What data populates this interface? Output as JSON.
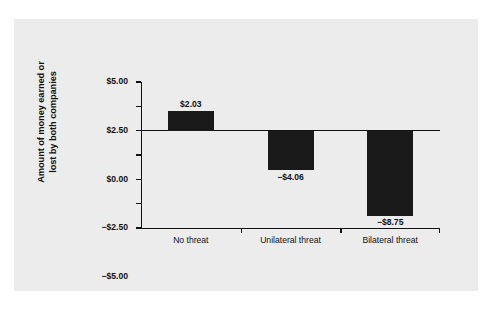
{
  "chart_data": {
    "type": "bar",
    "title": "",
    "xlabel": "",
    "ylabel_line1": "Amount of money earned or",
    "ylabel_line2": "lost by both companies",
    "categories": [
      "No threat",
      "Unilateral threat",
      "Bilateral threat"
    ],
    "values": [
      2.03,
      -4.06,
      -8.75
    ],
    "value_labels": [
      "$2.03",
      "−$4.06",
      "−$8.75"
    ],
    "ylim": [
      -10.0,
      5.0
    ],
    "ytick_values": [
      5.0,
      2.5,
      0.0,
      -2.5,
      -5.0,
      -7.5,
      -10.0
    ],
    "ytick_labels": [
      "$5.00",
      "$2.50",
      "$0.00",
      "−$2.50",
      "−$5.00",
      "−$7.50",
      "−$10.00"
    ],
    "grid": false,
    "legend": false,
    "bar_color": "#1a1a1a",
    "axis_color": "#111111",
    "panel_color": "#ececec"
  }
}
